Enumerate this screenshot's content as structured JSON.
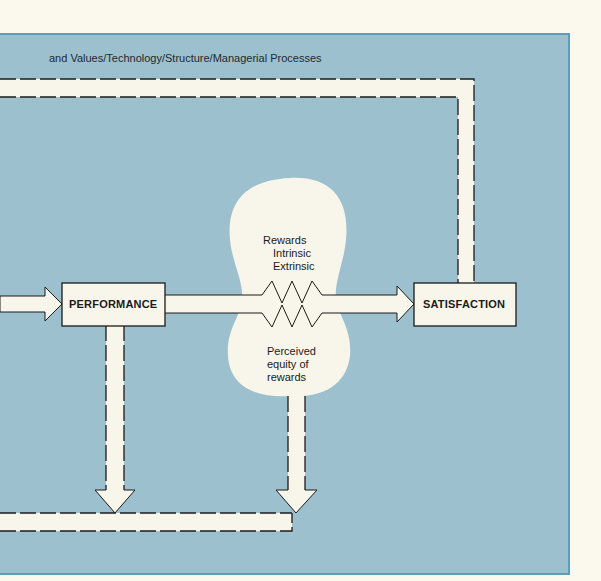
{
  "diagram": {
    "caption": "and Values/Technology/Structure/Managerial Processes",
    "nodes": {
      "performance": "PERFORMANCE",
      "satisfaction": "SATISFACTION"
    },
    "cloud": {
      "rewards_title": "Rewards",
      "rewards_intrinsic": "Intrinsic",
      "rewards_extrinsic": "Extrinsic",
      "equity_line1": "Perceived",
      "equity_line2": "equity of",
      "equity_line3": "rewards"
    },
    "colors": {
      "panel_bg": "#9dc0ce",
      "panel_border": "#5f9cb6",
      "page_bg": "#fbf8ee",
      "shape_fill": "#f8f5ea",
      "line": "#1b1b1b"
    }
  }
}
